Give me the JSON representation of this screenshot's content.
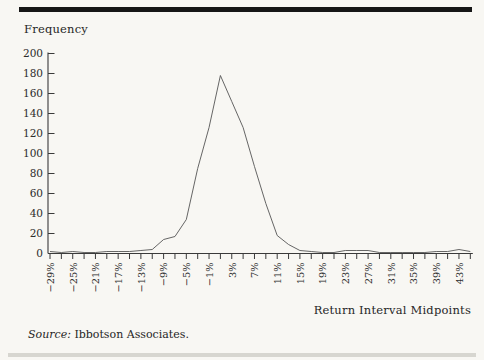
{
  "page": {
    "background": "#f8f7f3",
    "top_rule_color": "#161616",
    "bottom_rule_color": "#d7d6d0",
    "axis_color": "#3a3a3a",
    "text_color": "#2b2b2b"
  },
  "chart": {
    "y_axis_title": "Frequency",
    "x_axis_title": "Return Interval Midpoints",
    "source_prefix": "Source:",
    "source_text": " Ibbotson Associates."
  },
  "chart_data": {
    "type": "line",
    "title": "",
    "xlabel": "Return Interval Midpoints",
    "ylabel": "Frequency",
    "x_midpoints_percent": [
      -29,
      -27,
      -25,
      -23,
      -21,
      -19,
      -17,
      -15,
      -13,
      -11,
      -9,
      -7,
      -5,
      -3,
      -1,
      1,
      3,
      5,
      7,
      9,
      11,
      13,
      15,
      17,
      19,
      21,
      23,
      25,
      27,
      29,
      31,
      33,
      35,
      37,
      39,
      41,
      43,
      45
    ],
    "frequencies": [
      2,
      1,
      2,
      1,
      1,
      2,
      2,
      2,
      3,
      4,
      14,
      17,
      34,
      85,
      126,
      178,
      152,
      126,
      87,
      50,
      18,
      9,
      3,
      2,
      1,
      1,
      3,
      3,
      3,
      1,
      1,
      1,
      1,
      1,
      2,
      2,
      4,
      2
    ],
    "x_tick_labels": [
      "−29%",
      "−25%",
      "−21%",
      "−17%",
      "−13%",
      "−9%",
      "−5%",
      "−1%",
      "3%",
      "7%",
      "11%",
      "15%",
      "19%",
      "23%",
      "27%",
      "31%",
      "35%",
      "39%",
      "43%"
    ],
    "x_label_every": 2,
    "y_tick_values": [
      0,
      20,
      40,
      60,
      80,
      100,
      120,
      140,
      160,
      180,
      200
    ],
    "ylim": [
      0,
      200
    ],
    "grid": false,
    "legend": "none",
    "line_color": "#555555",
    "peak": {
      "midpoint_percent": 1,
      "frequency": 178
    }
  }
}
